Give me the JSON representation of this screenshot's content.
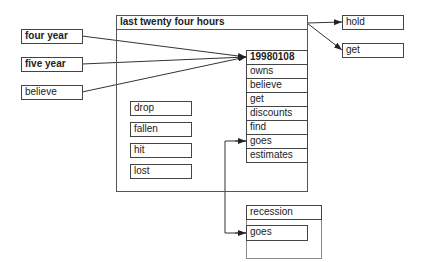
{
  "diagram": {
    "inputs": [
      {
        "label": "four year",
        "bold": true
      },
      {
        "label": "five year",
        "bold": true
      },
      {
        "label": "believe",
        "bold": false
      }
    ],
    "main_frame": {
      "title": "last twenty four hours",
      "side_items": [
        "drop",
        "fallen",
        "hit",
        "lost"
      ],
      "column": [
        "19980108",
        "owns",
        "believe",
        "get",
        "discounts",
        "find",
        "goes",
        "estimates"
      ]
    },
    "outputs": [
      "hold",
      "get"
    ],
    "secondary_frame": {
      "title": "recession",
      "items": [
        "goes"
      ]
    },
    "edges": [
      {
        "from": "four year",
        "to": "19980108"
      },
      {
        "from": "five year",
        "to": "19980108"
      },
      {
        "from": "believe",
        "to": "19980108"
      },
      {
        "from": "last twenty four hours",
        "to": "hold"
      },
      {
        "from": "last twenty four hours",
        "to": "get"
      },
      {
        "from": "goes (recession)",
        "to": "goes (last twenty four hours)"
      }
    ]
  }
}
